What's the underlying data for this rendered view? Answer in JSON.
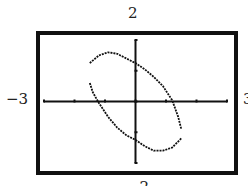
{
  "window_labels": {
    "ymax": "2",
    "ymin": "−2",
    "xmin": "−3",
    "xmax": "3"
  },
  "colors": {
    "frame": "#111111",
    "axis": "#111111",
    "curve": "#111111",
    "background": "#ffffff"
  },
  "chart_data": {
    "type": "line",
    "title": "",
    "xlabel": "",
    "ylabel": "",
    "xlim": [
      -3,
      3
    ],
    "ylim": [
      -2,
      2
    ],
    "xticks": [
      -3,
      -2,
      -1,
      0,
      1,
      2,
      3
    ],
    "yticks": [
      -2,
      -1,
      0,
      1,
      2
    ],
    "grid": false,
    "series": [
      {
        "name": "upper branch",
        "x": [
          -1.5,
          -1.2,
          -0.9,
          -0.6,
          -0.3,
          0.0,
          0.3,
          0.6,
          0.9,
          1.2,
          1.4,
          1.5
        ],
        "y": [
          1.25,
          1.5,
          1.6,
          1.55,
          1.4,
          1.25,
          1.05,
          0.8,
          0.5,
          0.05,
          -0.5,
          -0.9
        ]
      },
      {
        "name": "lower branch",
        "x": [
          -1.5,
          -1.4,
          -1.2,
          -0.9,
          -0.6,
          -0.3,
          0.0,
          0.3,
          0.6,
          0.9,
          1.2,
          1.5
        ],
        "y": [
          0.6,
          0.3,
          -0.05,
          -0.5,
          -0.85,
          -1.1,
          -1.25,
          -1.45,
          -1.6,
          -1.6,
          -1.5,
          -1.2
        ]
      }
    ]
  }
}
